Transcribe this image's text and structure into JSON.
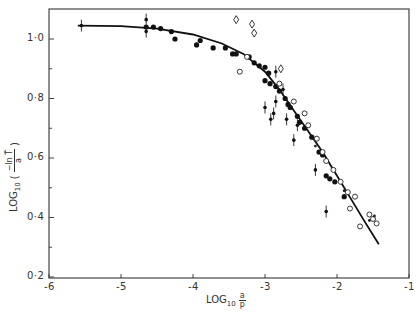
{
  "chart_data": {
    "type": "scatter",
    "title": "",
    "xlabel": "LOG10 a/p",
    "ylabel": "LOG10 (-ln T̄ / a)",
    "xlim": [
      -6,
      -1
    ],
    "ylim": [
      0.2,
      1.1
    ],
    "x_ticks": [
      -6,
      -5,
      -4,
      -3,
      -2,
      -1
    ],
    "x_tick_labels": [
      "-6",
      "-5",
      "-4",
      "-3",
      "-2",
      "-1"
    ],
    "y_ticks": [
      0.2,
      0.4,
      0.6,
      0.8,
      1.0
    ],
    "y_tick_labels": [
      "0·2",
      "0·4",
      "0·6",
      "0·8",
      "1·0"
    ],
    "grid": false,
    "legend": "none",
    "fitted_curve": {
      "name": "fitted curve",
      "x": [
        -5.6,
        -5.0,
        -4.5,
        -4.0,
        -3.6,
        -3.3,
        -3.0,
        -2.8,
        -2.6,
        -2.4,
        -2.2,
        -2.0,
        -1.8,
        -1.6,
        -1.42
      ],
      "y": [
        1.045,
        1.043,
        1.035,
        1.015,
        0.985,
        0.95,
        0.89,
        0.83,
        0.76,
        0.69,
        0.62,
        0.54,
        0.46,
        0.38,
        0.31
      ]
    },
    "series": [
      {
        "name": "filled circles",
        "marker": "filled-circle",
        "points": [
          [
            -4.65,
            1.04
          ],
          [
            -4.55,
            1.04
          ],
          [
            -4.45,
            1.035
          ],
          [
            -4.3,
            1.025
          ],
          [
            -4.25,
            1.0
          ],
          [
            -3.95,
            0.98
          ],
          [
            -3.9,
            0.995
          ],
          [
            -3.72,
            0.97
          ],
          [
            -3.55,
            0.97
          ],
          [
            -3.45,
            0.95
          ],
          [
            -3.4,
            0.95
          ],
          [
            -3.22,
            0.94
          ],
          [
            -3.15,
            0.92
          ],
          [
            -3.08,
            0.91
          ],
          [
            -3.0,
            0.905
          ],
          [
            -3.0,
            0.86
          ],
          [
            -2.95,
            0.885
          ],
          [
            -2.93,
            0.85
          ],
          [
            -2.85,
            0.84
          ],
          [
            -2.8,
            0.825
          ],
          [
            -2.72,
            0.8
          ],
          [
            -2.68,
            0.78
          ],
          [
            -2.65,
            0.77
          ],
          [
            -2.55,
            0.74
          ],
          [
            -2.52,
            0.72
          ],
          [
            -2.45,
            0.7
          ],
          [
            -2.35,
            0.67
          ],
          [
            -2.25,
            0.62
          ],
          [
            -2.2,
            0.61
          ],
          [
            -2.15,
            0.54
          ],
          [
            -2.1,
            0.53
          ],
          [
            -2.03,
            0.52
          ],
          [
            -1.9,
            0.47
          ]
        ]
      },
      {
        "name": "open circles",
        "marker": "open-circle",
        "points": [
          [
            -3.35,
            0.89
          ],
          [
            -3.25,
            0.94
          ],
          [
            -2.8,
            0.85
          ],
          [
            -2.6,
            0.79
          ],
          [
            -2.45,
            0.75
          ],
          [
            -2.4,
            0.71
          ],
          [
            -2.28,
            0.665
          ],
          [
            -2.2,
            0.62
          ],
          [
            -2.15,
            0.59
          ],
          [
            -2.05,
            0.56
          ],
          [
            -1.95,
            0.52
          ],
          [
            -1.85,
            0.485
          ],
          [
            -1.82,
            0.43
          ],
          [
            -1.75,
            0.47
          ],
          [
            -1.68,
            0.37
          ],
          [
            -1.55,
            0.41
          ],
          [
            -1.5,
            0.395
          ],
          [
            -1.45,
            0.38
          ]
        ]
      },
      {
        "name": "open diamonds",
        "marker": "open-diamond",
        "points": [
          [
            -3.4,
            1.065
          ],
          [
            -3.18,
            1.05
          ],
          [
            -3.15,
            1.02
          ],
          [
            -2.78,
            0.9
          ]
        ]
      },
      {
        "name": "small dots",
        "marker": "small-dot",
        "points": [
          [
            -2.3,
            0.64
          ],
          [
            -1.9,
            0.49
          ],
          [
            -1.55,
            0.39
          ],
          [
            -1.48,
            0.405
          ]
        ]
      },
      {
        "name": "points with vertical error bars",
        "marker": "dot-errorbar",
        "points": [
          [
            -5.55,
            1.045
          ],
          [
            -4.65,
            1.065
          ],
          [
            -4.65,
            1.025
          ],
          [
            -3.0,
            0.77
          ],
          [
            -2.92,
            0.73
          ],
          [
            -2.88,
            0.75
          ],
          [
            -2.85,
            0.79
          ],
          [
            -2.75,
            0.83
          ],
          [
            -2.7,
            0.73
          ],
          [
            -2.6,
            0.66
          ],
          [
            -2.55,
            0.71
          ],
          [
            -2.85,
            0.89
          ],
          [
            -2.3,
            0.56
          ],
          [
            -2.15,
            0.42
          ]
        ]
      }
    ]
  },
  "axes": {
    "x_tick_labels": [
      "-6",
      "-5",
      "-4",
      "-3",
      "-2",
      "-1"
    ],
    "y_tick_labels": [
      "0·2",
      "0·4",
      "0·6",
      "0·8",
      "1·0"
    ],
    "xlabel": {
      "prefix": "LOG",
      "sub": "10",
      "num": "a",
      "den": "p"
    },
    "ylabel": {
      "prefix": "LOG",
      "sub": "10",
      "num": "−ln T̄",
      "den": "a"
    }
  }
}
